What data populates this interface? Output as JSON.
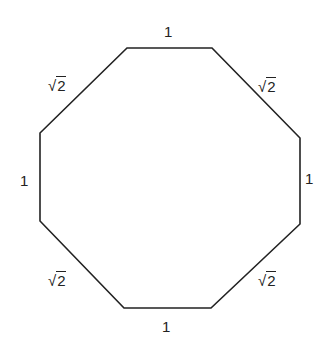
{
  "diagram": {
    "shape": "regular-octagon-like",
    "stroke_color": "#222222",
    "vertices": [
      [
        127,
        48
      ],
      [
        212,
        48
      ],
      [
        300,
        138
      ],
      [
        300,
        224
      ],
      [
        211,
        308
      ],
      [
        124,
        308
      ],
      [
        40,
        221
      ],
      [
        40,
        133
      ]
    ],
    "labels": {
      "top": "1",
      "top_right": "2",
      "right": "1",
      "bottom_right": "2",
      "bottom": "1",
      "bottom_left": "2",
      "left": "1",
      "top_left": "2"
    },
    "radical_symbol": "√"
  }
}
